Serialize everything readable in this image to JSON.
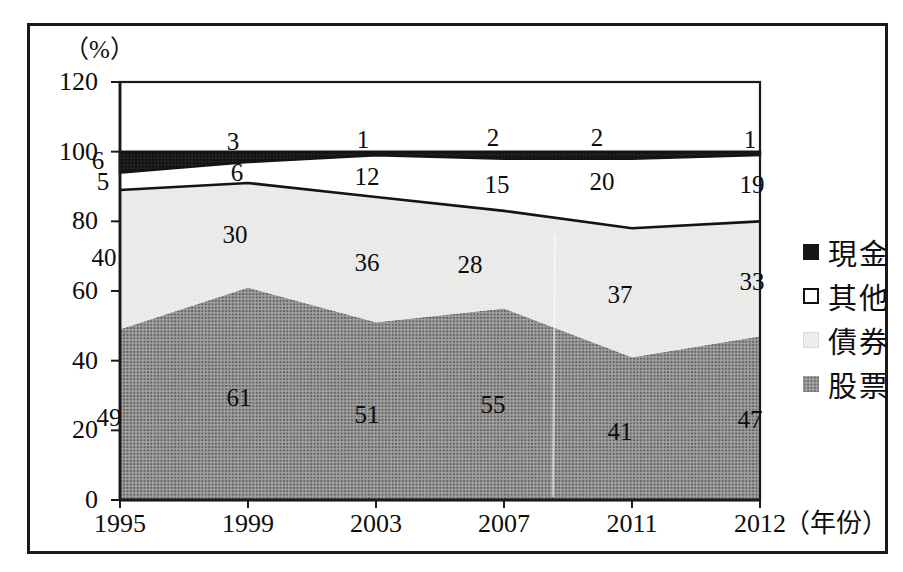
{
  "figure": {
    "background": "#ffffff",
    "border_color": "#1a1a1a"
  },
  "chart_data": {
    "type": "area",
    "stacked": true,
    "percent": true,
    "title": "",
    "ylabel": "（%）",
    "xlabel": "（年份）",
    "x_categories": [
      "1995",
      "1999",
      "2003",
      "2007",
      "2011",
      "2012"
    ],
    "yticks": [
      "0",
      "20",
      "40",
      "60",
      "80",
      "100",
      "120"
    ],
    "ylim": [
      0,
      120
    ],
    "grid": false,
    "legend_position": "right",
    "series": [
      {
        "id": "stock",
        "name": "股票",
        "values": [
          49,
          61,
          51,
          55,
          41,
          47
        ],
        "color": "#8e8e8e",
        "style": "halftone-gray"
      },
      {
        "id": "bond",
        "name": "債券",
        "values": [
          40,
          30,
          36,
          28,
          37,
          33
        ],
        "color": "#ebebe9",
        "style": "light-gray"
      },
      {
        "id": "other",
        "name": "其他",
        "values": [
          5,
          6,
          12,
          15,
          20,
          19
        ],
        "color": "#ffffff",
        "style": "white-black-outline"
      },
      {
        "id": "cash",
        "name": "現金",
        "values": [
          6,
          3,
          1,
          2,
          2,
          1
        ],
        "color": "#141414",
        "style": "solid-black-halftone"
      }
    ],
    "legend": [
      {
        "id": "cash",
        "label": "現金"
      },
      {
        "id": "other",
        "label": "其他"
      },
      {
        "id": "bond",
        "label": "債券"
      },
      {
        "id": "stock",
        "label": "股票"
      }
    ]
  },
  "colors": {
    "boundary_line": "#141414",
    "text": "#111111"
  }
}
